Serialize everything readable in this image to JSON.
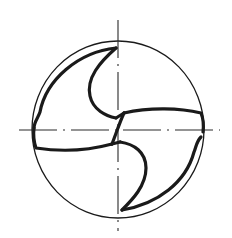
{
  "diagram": {
    "colors": {
      "background": "#ffffff",
      "stroke": "#1a1a1a",
      "centerline": "#2a2a2a"
    },
    "outer_circle": {
      "cx": 118,
      "cy": 129.5,
      "rx": 86,
      "ry": 88.5,
      "stroke_width": 1.3
    },
    "centerlines": {
      "vertical": {
        "x": 118,
        "y1": 20,
        "y2": 231,
        "dash": "38 6 2 6"
      },
      "horizontal": {
        "y": 130,
        "x1": 19,
        "x2": 220,
        "dash": "38 6 2 6"
      }
    },
    "profile_stroke_width": 3.2,
    "labels": []
  }
}
